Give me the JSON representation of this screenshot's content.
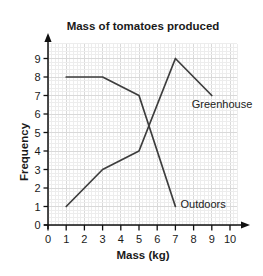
{
  "chart_data": {
    "type": "line",
    "title": "Mass of tomatoes produced",
    "xlabel": "Mass (kg)",
    "ylabel": "Frequency",
    "xlim": [
      0,
      10
    ],
    "ylim": [
      0,
      9
    ],
    "xticks": [
      "0",
      "1",
      "2",
      "3",
      "4",
      "5",
      "6",
      "7",
      "8",
      "9",
      "10"
    ],
    "yticks": [
      "0",
      "1",
      "2",
      "3",
      "4",
      "5",
      "6",
      "7",
      "8",
      "9"
    ],
    "grid": "fine graph-paper grid, minor every 0.2 units, major every 1 unit",
    "legend_position": "inline labels next to lines",
    "series": [
      {
        "name": "Greenhouse",
        "points": [
          [
            1,
            1
          ],
          [
            3,
            3
          ],
          [
            5,
            4
          ],
          [
            7,
            9
          ],
          [
            9,
            7
          ]
        ],
        "label_anchor_units": [
          7.9,
          6.35
        ]
      },
      {
        "name": "Outdoors",
        "points": [
          [
            1,
            8
          ],
          [
            3,
            8
          ],
          [
            5,
            7
          ],
          [
            7,
            1
          ]
        ],
        "label_anchor_units": [
          7.28,
          0.9
        ]
      }
    ],
    "colors": {
      "line": "#3d3d3d",
      "axis": "#111111",
      "text": "#1a1a1a",
      "grid_minor": "#ededed",
      "grid_major": "#d9d9d9",
      "background": "#ffffff"
    }
  }
}
